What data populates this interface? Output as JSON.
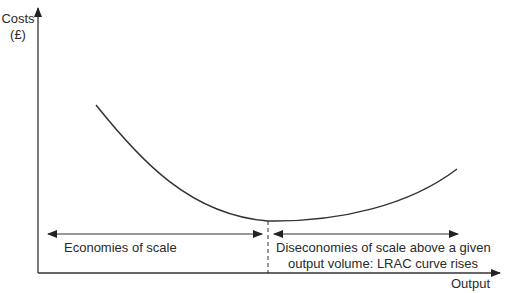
{
  "diagram": {
    "y_axis_label_line1": "Costs",
    "y_axis_label_line2": "(£)",
    "x_axis_label": "Output",
    "left_region_label": "Economies of scale",
    "right_region_label_line1": "Diseconomies of scale above a given",
    "right_region_label_line2": "output volume: LRAC curve rises",
    "curve": {
      "name": "LRAC",
      "start": [
        96,
        105
      ],
      "minimum": [
        268,
        221
      ],
      "end": [
        457,
        169
      ]
    },
    "colors": {
      "line": "#333333",
      "text": "#2a2a2a",
      "background": "#ffffff"
    }
  }
}
